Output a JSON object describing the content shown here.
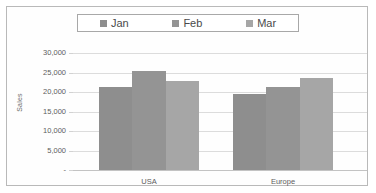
{
  "chart_data": {
    "type": "bar",
    "title": "",
    "xlabel": "",
    "ylabel": "Sales",
    "categories": [
      "USA",
      "Europe"
    ],
    "series": [
      {
        "name": "Jan",
        "color": "#8e8e8e",
        "values": [
          21300,
          19400
        ]
      },
      {
        "name": "Feb",
        "color": "#949494",
        "values": [
          25300,
          21400
        ]
      },
      {
        "name": "Mar",
        "color": "#a6a6a6",
        "values": [
          22800,
          23600
        ]
      }
    ],
    "ylim": [
      0,
      30000
    ],
    "ytick_values": [
      0,
      5000,
      10000,
      15000,
      20000,
      25000,
      30000
    ],
    "ytick_labels": [
      "-",
      "5,000",
      "10,000",
      "15,000",
      "20,000",
      "25,000",
      "30,000"
    ],
    "grid": true,
    "legend_position": "top"
  },
  "legend": {
    "items": [
      {
        "label": "Jan"
      },
      {
        "label": "Feb"
      },
      {
        "label": "Mar"
      }
    ]
  },
  "axes": {
    "y_title": "Sales"
  },
  "colors": {
    "series_jan": "#8e8e8e",
    "series_feb": "#949494",
    "series_mar": "#a6a6a6",
    "gridline": "#dcdcdc",
    "border": "#b9b9b9",
    "text": "#5d5d5d"
  }
}
